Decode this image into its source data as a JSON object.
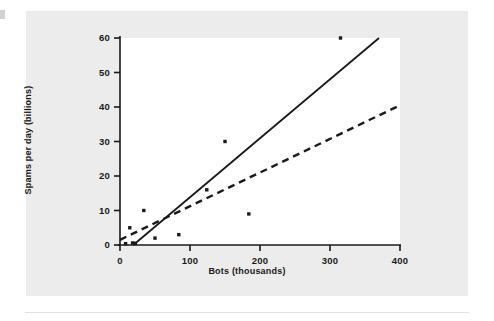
{
  "figure": {
    "background_color": "#ececec",
    "plot_area_color": "#ffffff",
    "ink_color": "#1a1a1a"
  },
  "chart_data": {
    "type": "scatter",
    "title": "",
    "subtitle": "",
    "xlabel": "Bots (thousands)",
    "ylabel": "Spams per day (billions)",
    "xlim": [
      0,
      400
    ],
    "ylim": [
      0,
      60
    ],
    "xticks": [
      0,
      100,
      200,
      300,
      400
    ],
    "yticks": [
      0,
      10,
      20,
      30,
      40,
      50,
      60
    ],
    "xtick_labels": [
      "0",
      "100",
      "200",
      "300",
      "400"
    ],
    "ytick_labels": [
      "0",
      "10",
      "20",
      "30",
      "40",
      "50",
      "60"
    ],
    "grid": false,
    "legend": "none",
    "points": [
      {
        "x": 8,
        "y": 0.4
      },
      {
        "x": 14,
        "y": 5.0
      },
      {
        "x": 18,
        "y": 0.6
      },
      {
        "x": 22,
        "y": 0.5
      },
      {
        "x": 34,
        "y": 10.0
      },
      {
        "x": 50,
        "y": 2.0
      },
      {
        "x": 84,
        "y": 3.0
      },
      {
        "x": 124,
        "y": 16.0
      },
      {
        "x": 150,
        "y": 30.0
      },
      {
        "x": 184,
        "y": 9.0
      },
      {
        "x": 315,
        "y": 60.0
      }
    ],
    "lines": [
      {
        "name": "solid-fit-line",
        "style": "solid",
        "x_start": 19,
        "y_start": 0,
        "x_end": 370,
        "y_end": 60
      },
      {
        "name": "dashed-fit-line",
        "style": "dashed",
        "x_start": 0,
        "y_start": 1.5,
        "x_end": 400,
        "y_end": 40.5
      }
    ]
  }
}
